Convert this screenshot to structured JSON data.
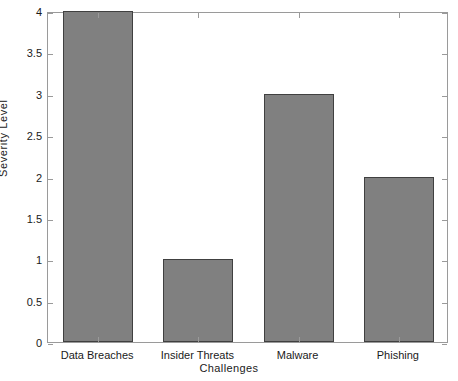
{
  "chart_data": {
    "type": "bar",
    "title": "",
    "subtitle": "",
    "xlabel": "Challenges",
    "ylabel": "Severity Level",
    "categories": [
      "Data Breaches",
      "Insider Threats",
      "Malware",
      "Phishing"
    ],
    "values": [
      4,
      1,
      3,
      2
    ],
    "series": [
      {
        "name": "Severity Level",
        "values": [
          4,
          1,
          3,
          2
        ]
      }
    ],
    "ylim": [
      0,
      4
    ],
    "xlim": [
      0,
      5
    ],
    "ytick_labels": [
      "0",
      "0.5",
      "1",
      "1.5",
      "2",
      "2.5",
      "3",
      "3.5",
      "4"
    ],
    "ytick_values": [
      0,
      0.5,
      1,
      1.5,
      2,
      2.5,
      3,
      3.5,
      4
    ],
    "grid": false,
    "legend": null,
    "legend_position": "none",
    "annotations": [],
    "bar_color": "#808080",
    "bar_edge_color": "#404040",
    "axis_color": "#9a9a9a",
    "background_color": "#ffffff"
  },
  "axis_titles": {
    "y": "Severity Level",
    "x": "Challenges"
  }
}
